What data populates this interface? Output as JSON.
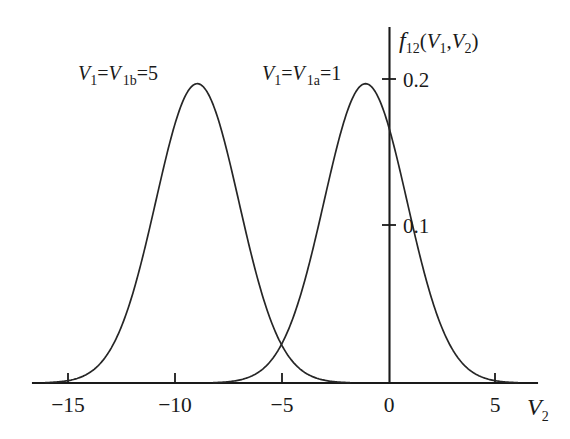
{
  "chart_data": {
    "type": "line",
    "title": "",
    "subtitle": "",
    "xlabel": "V2",
    "ylabel": "f12(V1,V2)",
    "xlim": [
      -17.5,
      6.5
    ],
    "ylim": [
      0,
      0.245
    ],
    "grid": false,
    "legend": "inline-annotations",
    "x_ticks": [
      -15,
      -10,
      -5,
      0,
      5
    ],
    "x_tick_labels": [
      "−15",
      "−10",
      "−5",
      "0",
      "5"
    ],
    "y_ticks": [
      0.1,
      0.2
    ],
    "y_tick_labels": [
      "0.1",
      "0.2"
    ],
    "series": [
      {
        "name": "V1=V1b=5",
        "label": "V₁=V₁ₑ=5",
        "distribution": "gaussian",
        "mean": -9.0,
        "sigma": 1.95,
        "peak_value": 0.205,
        "color": "#262626",
        "annotation_x": -13.6,
        "annotation_y": 0.217
      },
      {
        "name": "V1=V1a=1",
        "label": "V₁=V₁ₐ=1",
        "distribution": "gaussian",
        "mean": -1.1,
        "sigma": 1.95,
        "peak_value": 0.205,
        "color": "#262626",
        "annotation_x": -6.2,
        "annotation_y": 0.217
      }
    ],
    "annotations": [
      {
        "text": "intersection",
        "x": -5.0,
        "y": 0.024
      }
    ]
  },
  "labels": {
    "y_axis_f": "f",
    "y_axis_f_sub": "12",
    "y_axis_paren_open": "(",
    "y_axis_V1": "V",
    "y_axis_V1_sub": "1",
    "y_axis_comma": ",",
    "y_axis_V2": "V",
    "y_axis_V2_sub": "2",
    "y_axis_paren_close": ")",
    "x_axis_V": "V",
    "x_axis_V_sub": "2",
    "tick_y_02": "0.2",
    "tick_y_01": "0.1",
    "tick_x_m15": "−15",
    "tick_x_m10": "−10",
    "tick_x_m5": "−5",
    "tick_x_0": "0",
    "tick_x_5": "5",
    "curve_b_V": "V",
    "curve_b_sub1": "1",
    "curve_b_eq1": "=",
    "curve_b_V2": "V",
    "curve_b_sub2": "1b",
    "curve_b_eq2": "=5",
    "curve_a_V": "V",
    "curve_a_sub1": "1",
    "curve_a_eq1": "=",
    "curve_a_V2": "V",
    "curve_a_sub2": "1a",
    "curve_a_eq2": "=1"
  },
  "style": {
    "stroke_color": "#262626",
    "axis_color": "#1a1a1a",
    "background": "#ffffff"
  }
}
